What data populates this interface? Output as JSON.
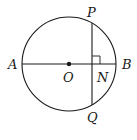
{
  "diagram": {
    "labels": {
      "A": "A",
      "B": "B",
      "O": "O",
      "N": "N",
      "P": "P",
      "Q": "Q"
    },
    "stroke_color": "#1a1a1a"
  }
}
